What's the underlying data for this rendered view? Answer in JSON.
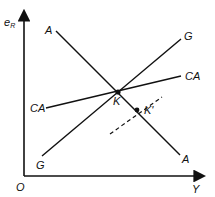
{
  "diagram": {
    "type": "economics-schedule-diagram",
    "axes": {
      "y_label_main": "e",
      "y_label_sub": "R",
      "x_label": "Y",
      "origin_label": "O"
    },
    "lines": [
      {
        "name": "A",
        "label_start": "A",
        "label_end": "A",
        "style": "solid",
        "from": [
          56,
          31
        ],
        "to": [
          180,
          155
        ]
      },
      {
        "name": "G",
        "label_start": "G",
        "label_end": "G",
        "style": "solid",
        "from": [
          42,
          156
        ],
        "to": [
          181,
          39
        ]
      },
      {
        "name": "CA",
        "label_start": "CA",
        "label_end": "CA",
        "style": "solid",
        "from": [
          46,
          108
        ],
        "to": [
          181,
          76
        ]
      },
      {
        "name": "shifted",
        "style": "dashed",
        "from": [
          110,
          134
        ],
        "to": [
          162,
          97
        ]
      }
    ],
    "points": [
      {
        "label": "K",
        "x": 118,
        "y": 92
      },
      {
        "label": "K'",
        "x": 137,
        "y": 110
      }
    ],
    "colors": {
      "ink": "#111111",
      "background": "#ffffff"
    }
  }
}
